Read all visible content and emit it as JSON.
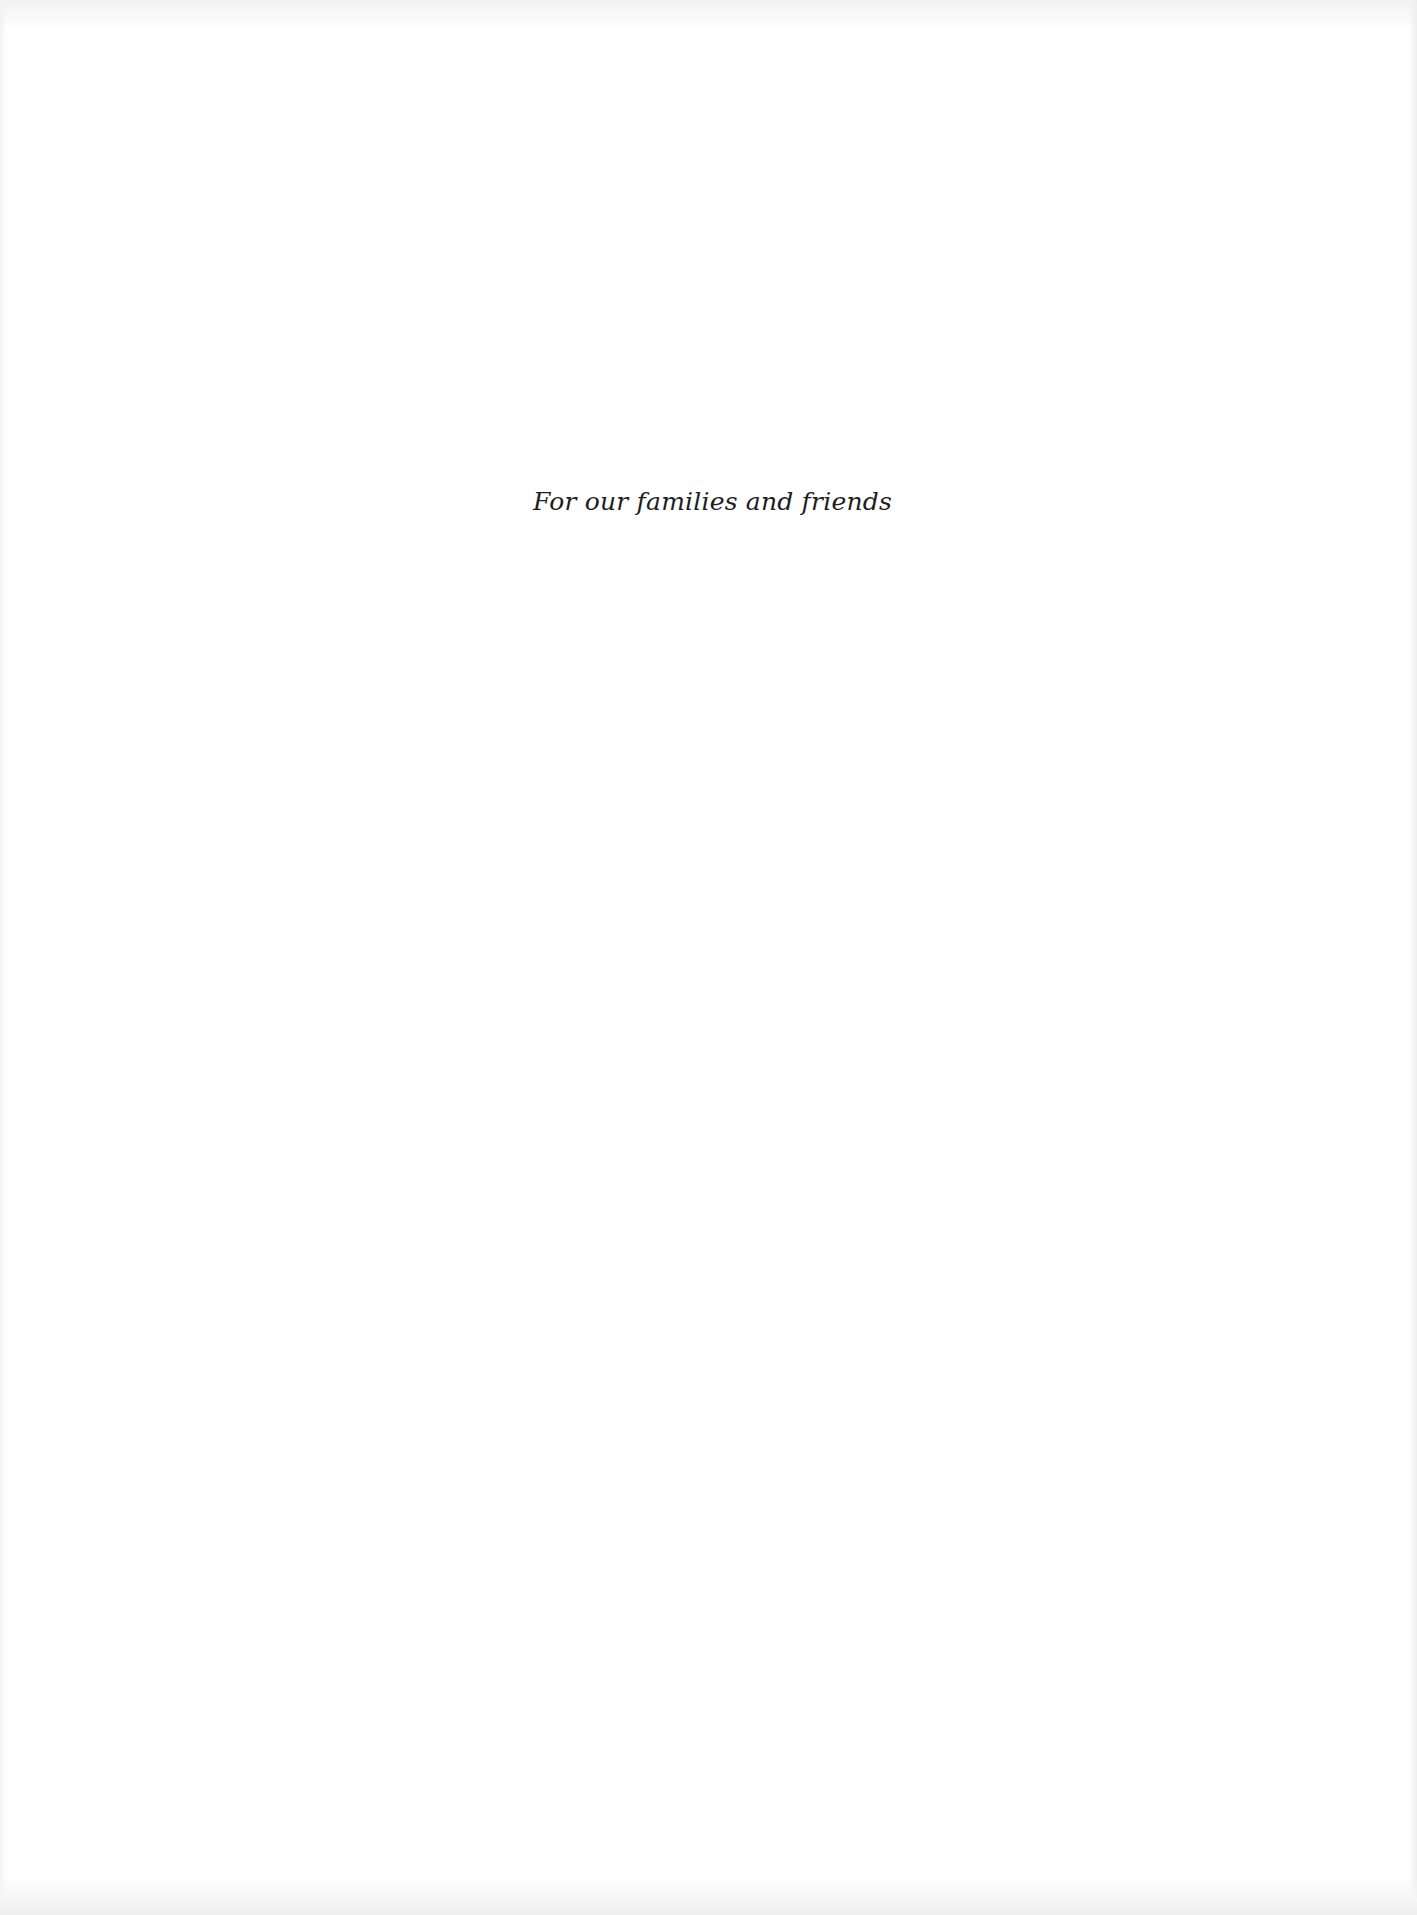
{
  "page": {
    "type": "dedication",
    "background_color": "#ffffff",
    "text_color": "#1e1e1e"
  },
  "dedication": {
    "text": "For our families and friends"
  }
}
